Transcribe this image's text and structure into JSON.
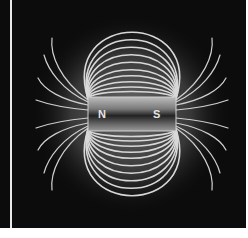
{
  "diagram": {
    "title": "",
    "magnet": {
      "north_label": "N",
      "south_label": "S",
      "x": 88,
      "y": 97,
      "width": 88,
      "height": 34
    },
    "colors": {
      "background": "#0c0c0c",
      "field_line": "#d8d8d8",
      "glow": "#6a6a6a",
      "magnet_light": "#9a9a9a",
      "magnet_dark": "#2a2a2a",
      "divider": "#e8e8e8"
    },
    "field_lines": {
      "loops_above": 10,
      "loops_below": 10,
      "end_fan_lines_per_pole": 8
    }
  }
}
